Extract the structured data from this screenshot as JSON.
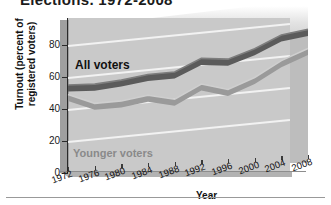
{
  "figure": {
    "title_clipped": "Elections, 1972-2008",
    "bottom_rule": true
  },
  "chart_data": {
    "type": "line",
    "title": "Elections, 1972-2008",
    "xlabel": "Year",
    "ylabel": "Turnout (percent of registered voters)",
    "categories": [
      "1972",
      "1976",
      "1980",
      "1984",
      "1988",
      "1992",
      "1996",
      "2000",
      "2004",
      "2008"
    ],
    "x": [
      1972,
      1976,
      1980,
      1984,
      1988,
      1992,
      1996,
      2000,
      2004,
      2008
    ],
    "ylim": [
      0,
      88
    ],
    "yticks": [
      0,
      20,
      40,
      60,
      80
    ],
    "ytick_labels": [
      "0",
      "20",
      "40",
      "60",
      "80"
    ],
    "grid": true,
    "grid_orientation": "horizontal",
    "legend_position": "inline-annotations",
    "style": "3d-ribbon",
    "series": [
      {
        "name": "All voters",
        "color": "#5b5b5b",
        "values": [
          55,
          54,
          55,
          57,
          57,
          64,
          62,
          67,
          74,
          76
        ]
      },
      {
        "name": "Younger voters",
        "color": "#9a9a9a",
        "values": [
          49,
          42,
          42,
          44,
          40,
          48,
          43,
          49,
          58,
          64
        ]
      }
    ],
    "annotations": [
      {
        "text": "All voters",
        "series": "All voters",
        "color": "#111111"
      },
      {
        "text": "Younger voters",
        "series": "Younger voters",
        "color": "#8a8a8a"
      }
    ]
  },
  "colors": {
    "all_voters_band": "#5b5b5b",
    "younger_voters_band": "#9a9a9a",
    "plot_background": "#c9c9c9",
    "gridline": "#f2f2f2",
    "axis": "#2a2a2a",
    "text": "#111111"
  }
}
